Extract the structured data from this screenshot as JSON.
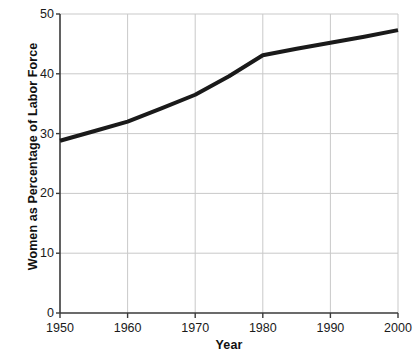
{
  "chart_data": {
    "type": "line",
    "title": "",
    "subtitle": "",
    "xlabel": "Year",
    "ylabel": "Women as Percentage of Labor Force",
    "xlim": [
      1950,
      2000
    ],
    "ylim": [
      0,
      50
    ],
    "x_ticks": [
      1950,
      1960,
      1970,
      1980,
      1990,
      2000
    ],
    "x_tick_labels": [
      "1950",
      "1960",
      "1970",
      "1980",
      "1990",
      "2000"
    ],
    "y_ticks": [
      0,
      10,
      20,
      30,
      40,
      50
    ],
    "y_tick_labels": [
      "0",
      "10",
      "20",
      "30",
      "40",
      "50"
    ],
    "grid": true,
    "grid_color": "#c9c9c9",
    "axis_color": "#3a3a3a",
    "legend": false,
    "legend_position": "none",
    "series": [
      {
        "name": "Women as Percentage of Labor Force",
        "color": "#1a1a1a",
        "line_width": 4,
        "markers": false,
        "x": [
          1950,
          1955,
          1960,
          1965,
          1970,
          1975,
          1980,
          1985,
          1990,
          1995,
          2000
        ],
        "values": [
          28.8,
          30.4,
          32.0,
          34.2,
          36.5,
          39.6,
          43.1,
          44.2,
          45.2,
          46.2,
          47.3
        ]
      }
    ]
  },
  "icons": {
    "chart_icon": "line-chart-icon"
  }
}
